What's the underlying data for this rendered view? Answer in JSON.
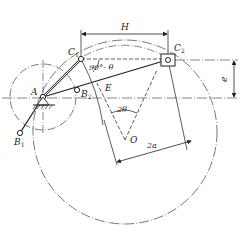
{
  "figure": {
    "labels": {
      "A": "A",
      "B1": "B",
      "B1_sub": "1",
      "B2": "B",
      "B2_sub": "2",
      "C1": "C",
      "C1_sub": "1",
      "C2": "C",
      "C2_sub": "2",
      "E": "E",
      "O": "O",
      "H": "H",
      "e": "e",
      "angle_90_minus_theta": "90°- θ",
      "angle_2theta": "2θ",
      "dim_2a": "2a"
    },
    "caption": ""
  }
}
